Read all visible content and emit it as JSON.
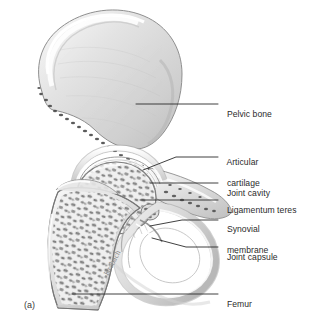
{
  "figure": {
    "panel_id": "(a)",
    "signature": "Krabach",
    "background_color": "#ffffff",
    "line_color": "#2b2b2b",
    "text_color": "#2b2b2b"
  },
  "labels": [
    {
      "id": "pelvic-bone",
      "text": "Pelvic bone",
      "x": 222,
      "y": 100,
      "lines": [
        "Pelvic bone"
      ]
    },
    {
      "id": "articular-cartilage",
      "text": "Articular cartilage",
      "x": 222,
      "y": 143,
      "lines": [
        "Articular",
        "cartilage"
      ]
    },
    {
      "id": "joint-cavity",
      "text": "Joint cavity",
      "x": 222,
      "y": 178,
      "lines": [
        "Joint cavity"
      ]
    },
    {
      "id": "ligamentum-teres",
      "text": "Ligamentum teres",
      "x": 222,
      "y": 195,
      "lines": [
        "Ligamentum teres"
      ]
    },
    {
      "id": "synovial-membrane",
      "text": "Synovial membrane",
      "x": 222,
      "y": 212,
      "lines": [
        "Synovial",
        "membrane"
      ]
    },
    {
      "id": "joint-capsule",
      "text": "Joint capsule",
      "x": 222,
      "y": 242,
      "lines": [
        "Joint capsule"
      ]
    },
    {
      "id": "femur",
      "text": "Femur",
      "x": 222,
      "y": 289,
      "lines": [
        "Femur"
      ]
    }
  ],
  "anatomy_parts": [
    "pelvic-bone-ilium",
    "acetabulum",
    "femoral-head",
    "femoral-neck",
    "greater-trochanter",
    "femoral-shaft",
    "pubic-ramus",
    "obturator-foramen",
    "trabecular-bone",
    "articular-cartilage-layer",
    "joint-capsule-band",
    "synovial-membrane-fold",
    "ligamentum-teres-bundle"
  ]
}
